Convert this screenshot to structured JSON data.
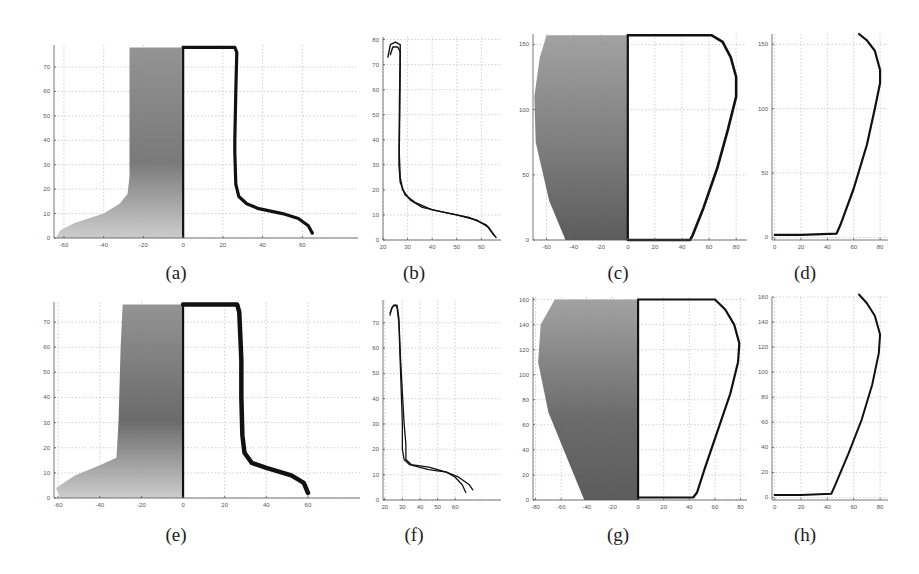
{
  "figure": {
    "captions": [
      "(a)",
      "(b)",
      "(c)",
      "(d)",
      "(e)",
      "(f)",
      "(g)",
      "(h)"
    ]
  },
  "colors": {
    "ink": "#111111",
    "grid": "#bdbdbd",
    "texture_light": "#c8c8c8",
    "texture_dark": "#6e6e6e"
  },
  "chart_data": [
    {
      "id": "a",
      "type": "line",
      "title": "(a)",
      "description": "Sherd texture (left half) with extracted profile (right half)",
      "xlim": [
        -65,
        88
      ],
      "ylim": [
        0,
        79
      ],
      "xticks": [
        -60,
        -40,
        -20,
        0,
        20,
        40,
        60
      ],
      "yticks": [
        0,
        10,
        20,
        30,
        40,
        50,
        60,
        70
      ],
      "grid": true,
      "series": [
        {
          "name": "profile",
          "points": [
            [
              0,
              78
            ],
            [
              26,
              78
            ],
            [
              27,
              76
            ],
            [
              26.5,
              60
            ],
            [
              26,
              40
            ],
            [
              26,
              35
            ],
            [
              26.5,
              22
            ],
            [
              28,
              17
            ],
            [
              32,
              14
            ],
            [
              38,
              12
            ],
            [
              50,
              10
            ],
            [
              58,
              8
            ],
            [
              63,
              5
            ],
            [
              65,
              2
            ]
          ]
        }
      ],
      "texture_outline": [
        [
          -0.5,
          0
        ],
        [
          -64,
          0
        ],
        [
          -62,
          3
        ],
        [
          -55,
          6
        ],
        [
          -40,
          10
        ],
        [
          -32,
          14
        ],
        [
          -28,
          18
        ],
        [
          -27,
          25
        ],
        [
          -27,
          78
        ],
        [
          -0.5,
          78
        ]
      ]
    },
    {
      "id": "b",
      "type": "line",
      "title": "(b)",
      "xlim": [
        20,
        68
      ],
      "ylim": [
        0,
        81
      ],
      "xticks": [
        20,
        30,
        40,
        50,
        60
      ],
      "yticks": [
        0,
        10,
        20,
        30,
        40,
        50,
        60,
        70,
        80
      ],
      "grid": true,
      "series": [
        {
          "name": "profile-1",
          "points": [
            [
              22,
              73
            ],
            [
              23,
              78
            ],
            [
              25,
              79
            ],
            [
              27,
              78
            ],
            [
              27,
              70
            ],
            [
              26.8,
              50
            ],
            [
              26.6,
              35
            ],
            [
              27,
              25
            ],
            [
              28,
              20
            ],
            [
              31,
              16
            ],
            [
              36,
              13
            ],
            [
              45,
              11
            ],
            [
              55,
              9
            ],
            [
              62,
              6
            ],
            [
              66,
              1
            ]
          ]
        },
        {
          "name": "profile-2",
          "points": [
            [
              23,
              74
            ],
            [
              24,
              77
            ],
            [
              26,
              77
            ],
            [
              27,
              75
            ],
            [
              26.7,
              55
            ],
            [
              26.5,
              30
            ],
            [
              27,
              23
            ],
            [
              29,
              18
            ],
            [
              33,
              15
            ],
            [
              40,
              12
            ],
            [
              50,
              10
            ],
            [
              58,
              8
            ],
            [
              63,
              5
            ],
            [
              65,
              2
            ]
          ]
        }
      ]
    },
    {
      "id": "c",
      "type": "line",
      "title": "(c)",
      "xlim": [
        -70,
        88
      ],
      "ylim": [
        0,
        158
      ],
      "xticks": [
        -60,
        -40,
        -20,
        0,
        20,
        40,
        60,
        80
      ],
      "yticks": [
        0,
        50,
        100,
        150
      ],
      "grid": true,
      "series": [
        {
          "name": "profile",
          "points": [
            [
              0,
              0
            ],
            [
              46,
              0
            ],
            [
              48,
              4
            ],
            [
              56,
              25
            ],
            [
              66,
              55
            ],
            [
              74,
              85
            ],
            [
              80,
              110
            ],
            [
              80,
              125
            ],
            [
              76,
              140
            ],
            [
              70,
              152
            ],
            [
              62,
              157
            ],
            [
              0,
              157
            ]
          ]
        }
      ],
      "texture_outline": [
        [
          -0.5,
          0
        ],
        [
          -46,
          0
        ],
        [
          -58,
          30
        ],
        [
          -68,
          75
        ],
        [
          -69,
          110
        ],
        [
          -65,
          140
        ],
        [
          -60,
          157
        ],
        [
          -0.5,
          157
        ]
      ]
    },
    {
      "id": "d",
      "type": "line",
      "title": "(d)",
      "xlim": [
        -2,
        86
      ],
      "ylim": [
        -2,
        158
      ],
      "xticks": [
        0,
        20,
        40,
        60,
        80
      ],
      "yticks": [
        0,
        50,
        100,
        150
      ],
      "grid": true,
      "series": [
        {
          "name": "profile",
          "points": [
            [
              0,
              2
            ],
            [
              20,
              2
            ],
            [
              47,
              3
            ],
            [
              50,
              10
            ],
            [
              60,
              38
            ],
            [
              70,
              72
            ],
            [
              76,
              100
            ],
            [
              80,
              120
            ],
            [
              80,
              130
            ],
            [
              76,
              145
            ],
            [
              70,
              153
            ],
            [
              64,
              158
            ]
          ]
        }
      ]
    },
    {
      "id": "e",
      "type": "line",
      "title": "(e)",
      "xlim": [
        -62,
        85
      ],
      "ylim": [
        0,
        78
      ],
      "xticks": [
        -60,
        -40,
        -20,
        0,
        20,
        40,
        60
      ],
      "yticks": [
        0,
        10,
        20,
        30,
        40,
        50,
        60,
        70
      ],
      "grid": true,
      "series": [
        {
          "name": "profile",
          "points": [
            [
              0,
              77
            ],
            [
              26,
              77
            ],
            [
              27,
              74
            ],
            [
              28,
              55
            ],
            [
              28,
              40
            ],
            [
              28.5,
              25
            ],
            [
              29.5,
              18
            ],
            [
              33,
              14
            ],
            [
              40,
              12
            ],
            [
              52,
              9
            ],
            [
              58,
              6
            ],
            [
              60,
              2
            ]
          ]
        }
      ],
      "texture_outline": [
        [
          -0.5,
          0
        ],
        [
          -59,
          0
        ],
        [
          -61,
          4
        ],
        [
          -52,
          9
        ],
        [
          -40,
          13
        ],
        [
          -32,
          16
        ],
        [
          -31,
          30
        ],
        [
          -30,
          60
        ],
        [
          -29,
          77
        ],
        [
          -0.5,
          77
        ]
      ]
    },
    {
      "id": "f",
      "type": "line",
      "title": "(f)",
      "xlim": [
        19,
        86
      ],
      "ylim": [
        0,
        79
      ],
      "xticks": [
        20,
        30,
        40,
        50,
        60
      ],
      "yticks": [
        0,
        10,
        20,
        30,
        40,
        50,
        60,
        70
      ],
      "grid": true,
      "series": [
        {
          "name": "profile-1",
          "points": [
            [
              23,
              73
            ],
            [
              24,
              76
            ],
            [
              26,
              77
            ],
            [
              27,
              76
            ],
            [
              28,
              70
            ],
            [
              29,
              50
            ],
            [
              30,
              30
            ],
            [
              30,
              20
            ],
            [
              31,
              16
            ],
            [
              34,
              14
            ],
            [
              45,
              12
            ],
            [
              55,
              11
            ],
            [
              62,
              9
            ],
            [
              68,
              6
            ],
            [
              70,
              4
            ]
          ]
        },
        {
          "name": "profile-2",
          "points": [
            [
              23,
              74
            ],
            [
              25,
              77
            ],
            [
              27,
              77
            ],
            [
              28,
              72
            ],
            [
              29,
              55
            ],
            [
              31,
              30
            ],
            [
              32,
              22
            ],
            [
              32,
              16
            ],
            [
              35,
              14
            ],
            [
              45,
              13
            ],
            [
              55,
              11
            ],
            [
              60,
              9
            ],
            [
              64,
              6
            ],
            [
              66,
              3
            ]
          ]
        }
      ]
    },
    {
      "id": "g",
      "type": "line",
      "title": "(g)",
      "xlim": [
        -82,
        85
      ],
      "ylim": [
        0,
        162
      ],
      "xticks": [
        -80,
        -60,
        -40,
        -20,
        0,
        20,
        40,
        60,
        80
      ],
      "yticks": [
        0,
        20,
        40,
        60,
        80,
        100,
        120,
        140,
        160
      ],
      "grid": true,
      "series": [
        {
          "name": "profile",
          "points": [
            [
              0,
              2
            ],
            [
              43,
              2
            ],
            [
              46,
              6
            ],
            [
              52,
              25
            ],
            [
              62,
              55
            ],
            [
              72,
              85
            ],
            [
              78,
              110
            ],
            [
              79,
              125
            ],
            [
              75,
              140
            ],
            [
              68,
              152
            ],
            [
              60,
              160
            ],
            [
              0,
              160
            ]
          ]
        }
      ],
      "texture_outline": [
        [
          -0.5,
          0
        ],
        [
          -42,
          0
        ],
        [
          -54,
          30
        ],
        [
          -70,
          70
        ],
        [
          -78,
          110
        ],
        [
          -76,
          140
        ],
        [
          -65,
          160
        ],
        [
          -0.5,
          160
        ]
      ]
    },
    {
      "id": "h",
      "type": "line",
      "title": "(h)",
      "xlim": [
        -2,
        86
      ],
      "ylim": [
        -2,
        160
      ],
      "xticks": [
        0,
        20,
        40,
        60,
        80
      ],
      "yticks": [
        0,
        20,
        40,
        60,
        80,
        100,
        120,
        140,
        160
      ],
      "grid": true,
      "series": [
        {
          "name": "profile",
          "points": [
            [
              0,
              2
            ],
            [
              20,
              2
            ],
            [
              43,
              3
            ],
            [
              46,
              10
            ],
            [
              56,
              35
            ],
            [
              66,
              62
            ],
            [
              74,
              90
            ],
            [
              79,
              115
            ],
            [
              80,
              130
            ],
            [
              76,
              145
            ],
            [
              70,
              155
            ],
            [
              64,
              162
            ]
          ]
        }
      ]
    }
  ],
  "layout": [
    {
      "id": "a",
      "x": 54,
      "y": 45,
      "w": 304,
      "h": 193,
      "cap_x": 176,
      "cap_y": 262
    },
    {
      "id": "b",
      "x": 383,
      "y": 37,
      "w": 118,
      "h": 203,
      "cap_x": 414,
      "cap_y": 262
    },
    {
      "id": "c",
      "x": 533,
      "y": 34,
      "w": 214,
      "h": 206,
      "cap_x": 618,
      "cap_y": 262
    },
    {
      "id": "d",
      "x": 772,
      "y": 34,
      "w": 116,
      "h": 206,
      "cap_x": 805,
      "cap_y": 262
    },
    {
      "id": "e",
      "x": 54,
      "y": 302,
      "w": 306,
      "h": 196,
      "cap_x": 176,
      "cap_y": 524
    },
    {
      "id": "f",
      "x": 383,
      "y": 300,
      "w": 118,
      "h": 200,
      "cap_x": 414,
      "cap_y": 524
    },
    {
      "id": "g",
      "x": 533,
      "y": 297,
      "w": 214,
      "h": 203,
      "cap_x": 618,
      "cap_y": 524
    },
    {
      "id": "h",
      "x": 772,
      "y": 297,
      "w": 116,
      "h": 203,
      "cap_x": 805,
      "cap_y": 524
    }
  ]
}
